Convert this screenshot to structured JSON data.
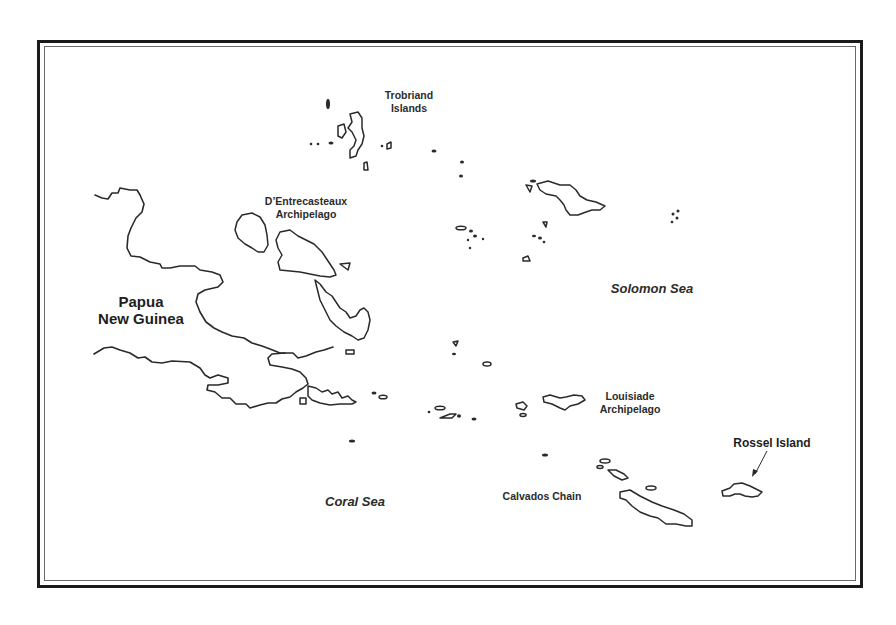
{
  "map": {
    "labels": {
      "trobriand": "Trobriand\nIslands",
      "trobriand_line1": "Trobriand",
      "trobriand_line2": "Islands",
      "dentrecasteaux_line1": "D’Entrecasteaux",
      "dentrecasteaux_line2": "Archipelago",
      "png_line1": "Papua",
      "png_line2": "New Guinea",
      "solomon_sea": "Solomon Sea",
      "coral_sea": "Coral Sea",
      "louisiade_line1": "Louisiade",
      "louisiade_line2": "Archipelago",
      "calvados": "Calvados Chain",
      "rossel": "Rossel Island"
    },
    "colors": {
      "background": "#ffffff",
      "outline": "#2a2a2a",
      "frame": "#1a1a1a"
    }
  }
}
